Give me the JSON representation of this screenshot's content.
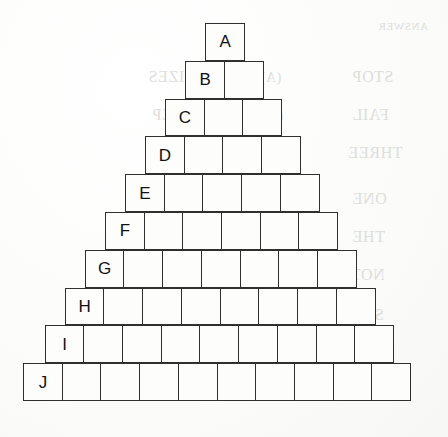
{
  "figure": {
    "kind": "block-pyramid",
    "background_color": "#fbfbfa",
    "block_fill_color": "#fdfdfc",
    "block_border_color": "#2f2f2f",
    "label_color": "#111111",
    "geometry": {
      "cell_width": 40.1,
      "cell_height": 37.8,
      "row_indent_step": 20.05,
      "apex_left": 205,
      "apex_top": 23,
      "base_left": 23,
      "base_top": 366,
      "base_right": 424,
      "base_bottom": 403
    },
    "rows": [
      {
        "label": "A",
        "cells": 1,
        "left": 205,
        "top": 23
      },
      {
        "label": "B",
        "cells": 2,
        "left": 185,
        "top": 60.8
      },
      {
        "label": "C",
        "cells": 3,
        "left": 164.9,
        "top": 98.6
      },
      {
        "label": "D",
        "cells": 4,
        "left": 144.9,
        "top": 136.4
      },
      {
        "label": "E",
        "cells": 5,
        "left": 124.8,
        "top": 174.2
      },
      {
        "label": "F",
        "cells": 6,
        "left": 104.8,
        "top": 212
      },
      {
        "label": "G",
        "cells": 7,
        "left": 84.7,
        "top": 249.8
      },
      {
        "label": "H",
        "cells": 8,
        "left": 64.7,
        "top": 287.6
      },
      {
        "label": "I",
        "cells": 9,
        "left": 44.6,
        "top": 325.4
      },
      {
        "label": "J",
        "cells": 10,
        "left": 23,
        "top": 363.2
      }
    ]
  },
  "bleed_through": {
    "note": "Faint mirrored show-through text from the reverse side of the page; decorative scan artifact.",
    "lines": [
      {
        "text": "ANSWER",
        "left": 378,
        "top": 20,
        "size": 11
      },
      {
        "text": "STOP",
        "left": 352,
        "top": 68,
        "size": 16
      },
      {
        "text": "SIZES",
        "left": 148,
        "top": 68,
        "size": 16
      },
      {
        "text": "(A)",
        "left": 260,
        "top": 70,
        "size": 14
      },
      {
        "text": "FAIL",
        "left": 352,
        "top": 106,
        "size": 16
      },
      {
        "text": "STEP",
        "left": 152,
        "top": 106,
        "size": 16
      },
      {
        "text": "(A)",
        "left": 262,
        "top": 108,
        "size": 14
      },
      {
        "text": "THREE",
        "left": 348,
        "top": 144,
        "size": 16
      },
      {
        "text": "INTO",
        "left": 152,
        "top": 144,
        "size": 16
      },
      {
        "text": "(A)",
        "left": 262,
        "top": 146,
        "size": 14
      },
      {
        "text": "ONE",
        "left": 352,
        "top": 190,
        "size": 16
      },
      {
        "text": "ARE",
        "left": 172,
        "top": 190,
        "size": 16
      },
      {
        "text": "(B)",
        "left": 262,
        "top": 192,
        "size": 14
      },
      {
        "text": "THE",
        "left": 352,
        "top": 228,
        "size": 16
      },
      {
        "text": "ING",
        "left": 176,
        "top": 228,
        "size": 16
      },
      {
        "text": "(B)",
        "left": 264,
        "top": 230,
        "size": 14
      },
      {
        "text": "NOT",
        "left": 350,
        "top": 266,
        "size": 16
      },
      {
        "text": "SHE",
        "left": 172,
        "top": 266,
        "size": 16
      },
      {
        "text": "(B)",
        "left": 262,
        "top": 268,
        "size": 14
      },
      {
        "text": "STO",
        "left": 352,
        "top": 306,
        "size": 16
      },
      {
        "text": "IST",
        "left": 180,
        "top": 306,
        "size": 16
      },
      {
        "text": "(C)",
        "left": 258,
        "top": 308,
        "size": 14
      },
      {
        "text": "RITE",
        "left": 346,
        "top": 344,
        "size": 16
      },
      {
        "text": "FUL",
        "left": 176,
        "top": 344,
        "size": 16
      },
      {
        "text": "(C)",
        "left": 258,
        "top": 346,
        "size": 14
      },
      {
        "text": "UNDER",
        "left": 336,
        "top": 382,
        "size": 16
      },
      {
        "text": "SOME",
        "left": 160,
        "top": 382,
        "size": 16
      },
      {
        "text": "(C)",
        "left": 262,
        "top": 384,
        "size": 14
      }
    ]
  }
}
